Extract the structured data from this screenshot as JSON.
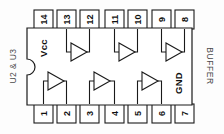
{
  "diagram": {
    "kind": "ic-pinout",
    "package": "DIP-14",
    "reference_designator": "U2 & U3",
    "function_label": "BUFFER",
    "power_labels": {
      "vcc": "Vcc",
      "gnd": "GND"
    },
    "colors": {
      "outline": "#1a1a1a",
      "body_fill": "#ffffff",
      "label_text": "#4a4a4a",
      "pin_text": "#111111",
      "background": "#fdfdfd"
    },
    "top_pins": [
      {
        "number": "14"
      },
      {
        "number": "13"
      },
      {
        "number": "12"
      },
      {
        "number": "11"
      },
      {
        "number": "10"
      },
      {
        "number": "9"
      },
      {
        "number": "8"
      }
    ],
    "bottom_pins": [
      {
        "number": "1"
      },
      {
        "number": "2"
      },
      {
        "number": "3"
      },
      {
        "number": "4"
      },
      {
        "number": "5"
      },
      {
        "number": "6"
      },
      {
        "number": "7"
      }
    ],
    "gates": [
      {
        "name": "buffer-top-1",
        "input_pin": "13",
        "output_pin": "12"
      },
      {
        "name": "buffer-top-2",
        "input_pin": "11",
        "output_pin": "10"
      },
      {
        "name": "buffer-top-3",
        "input_pin": "9",
        "output_pin": "8"
      },
      {
        "name": "buffer-bottom-1",
        "input_pin": "1",
        "output_pin": "2"
      },
      {
        "name": "buffer-bottom-2",
        "input_pin": "3",
        "output_pin": "4"
      },
      {
        "name": "buffer-bottom-3",
        "input_pin": "5",
        "output_pin": "6"
      }
    ]
  }
}
